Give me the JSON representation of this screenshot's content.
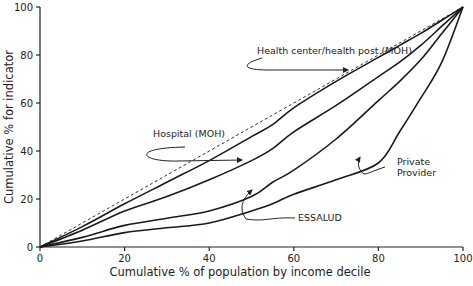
{
  "chart_data": {
    "type": "line",
    "title": "",
    "xlabel": "Cumulative % of population by income decile",
    "ylabel": "Cumulative % for indicator",
    "xlim": [
      0,
      100
    ],
    "ylim": [
      0,
      100
    ],
    "x_ticks": [
      0,
      20,
      40,
      60,
      80,
      100
    ],
    "y_ticks": [
      0,
      20,
      40,
      60,
      80,
      100
    ],
    "grid": false,
    "legend": "none (curves labeled by annotations with arrows)",
    "x": [
      0,
      10,
      20,
      30,
      40,
      50,
      55,
      60,
      70,
      80,
      85,
      90,
      95,
      100
    ],
    "series": [
      {
        "name": "Line of equality",
        "style": "dashed",
        "values": [
          0,
          10,
          20,
          30,
          40,
          50,
          55,
          60,
          70,
          80,
          85,
          90,
          95,
          100
        ]
      },
      {
        "name": "Health center/health post (MOH)",
        "style": "solid",
        "values": [
          0,
          8.5,
          18,
          27,
          36,
          46,
          51,
          58,
          69,
          79,
          84,
          89,
          94.5,
          100
        ]
      },
      {
        "name": "Hospital (MOH)",
        "style": "solid",
        "values": [
          0,
          7,
          15,
          21,
          28,
          36,
          41,
          48,
          59,
          71,
          77,
          84,
          92,
          100
        ]
      },
      {
        "name": "ESSALUD",
        "style": "solid",
        "values": [
          0,
          4,
          9,
          12,
          15,
          21,
          27,
          32,
          45,
          61,
          69,
          78,
          89,
          100
        ]
      },
      {
        "name": "Private Provider",
        "style": "solid",
        "values": [
          0,
          2.5,
          6,
          8,
          10,
          15,
          18,
          22,
          28,
          35,
          48,
          62,
          77,
          100
        ]
      }
    ],
    "annotations": [
      {
        "text": "Health center/health post (MOH)",
        "points_to": "Health center/health post (MOH)"
      },
      {
        "text": "Hospital (MOH)",
        "points_to": "Hospital (MOH)"
      },
      {
        "text": "ESSALUD",
        "points_to": "ESSALUD"
      },
      {
        "text": "Private",
        "text2": "Provider",
        "points_to": "Private Provider"
      }
    ]
  },
  "labels": {
    "xlabel": "Cumulative % of population by income decile",
    "ylabel": "Cumulative % for indicator",
    "annot_hc": "Health center/health post (MOH)",
    "annot_hosp": "Hospital (MOH)",
    "annot_essalud": "ESSALUD",
    "annot_private_1": "Private",
    "annot_private_2": "Provider"
  }
}
